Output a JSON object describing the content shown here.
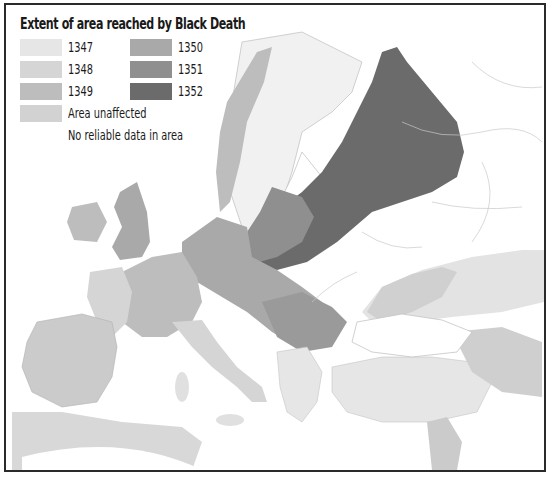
{
  "map": {
    "title": "Extent of area reached by Black Death",
    "region": "Europe, North Africa, Near East",
    "legend": [
      {
        "label": "1347",
        "color": "#e6e6e6"
      },
      {
        "label": "1348",
        "color": "#d5d5d5"
      },
      {
        "label": "1349",
        "color": "#bdbdbd"
      },
      {
        "label": "Area unaffected",
        "color": "#d2d2d2"
      },
      {
        "label": "No reliable data in area",
        "color": null
      },
      {
        "label": "1350",
        "color": "#a9a9a9"
      },
      {
        "label": "1351",
        "color": "#8f8f8f"
      },
      {
        "label": "1352",
        "color": "#6b6b6b"
      }
    ],
    "colors": {
      "background": "#ffffff",
      "frame": "#2a2a2a",
      "sea": "#ffffff",
      "border_lines": "#bdbdbd"
    }
  }
}
